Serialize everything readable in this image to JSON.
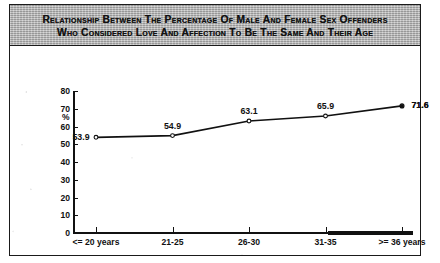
{
  "figure": {
    "title_line_1": "Relationship between the Percentage of Male and Female Sex Offenders",
    "title_line_2": "Who Considered Love and Affection to Be the Same and Their Age"
  },
  "chart_data": {
    "type": "line",
    "title": "Relationship between the Percentage of Male and Female Sex Offenders Who Considered Love and Affection to Be the Same and Their Age",
    "categories": [
      "<= 20 years",
      "21-25",
      "26-30",
      "31-35",
      ">= 36 years"
    ],
    "values": [
      53.9,
      54.9,
      63.1,
      65.9,
      71.6
    ],
    "point_labels": [
      "53.9",
      "54.9",
      "63.1",
      "65.9",
      "71.6"
    ],
    "xlabel": "",
    "ylabel": "%",
    "ylim": [
      0,
      80
    ],
    "ytick_labels": [
      "80",
      "70",
      "60",
      "50",
      "40",
      "30",
      "20",
      "10",
      "0"
    ],
    "ytick_values": [
      80,
      70,
      60,
      50,
      40,
      30,
      20,
      10,
      0
    ],
    "ytick_step": 10,
    "grid": false,
    "legend": false,
    "marker": "open-circle",
    "line_color": "#111111",
    "title_band_color": "#b6b6b6",
    "text_color": "#111111"
  }
}
